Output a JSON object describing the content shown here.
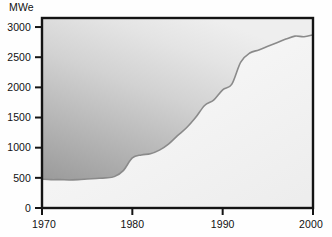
{
  "chart_data": {
    "type": "area",
    "title": "",
    "subtitle": "",
    "xlabel": "",
    "ylabel": "MWe",
    "ylabel_position": "top-left",
    "xlim": [
      1970,
      2000
    ],
    "ylim": [
      0,
      3150
    ],
    "grid": false,
    "legend": null,
    "annotations": [],
    "axis": {
      "y_ticks": [
        0,
        500,
        1000,
        1500,
        2000,
        2500,
        3000
      ],
      "y_tick_labels": [
        "0",
        "500",
        "1000",
        "1500",
        "2000",
        "2500",
        "3000"
      ],
      "x_ticks": [
        1970,
        1980,
        1990,
        2000
      ],
      "x_tick_labels": [
        "1970",
        "1980",
        "1990",
        "2000"
      ],
      "y_tick_side": "left",
      "x_tick_side": "bottom"
    },
    "series": [
      {
        "name": "Installed capacity",
        "unit": "MWe",
        "fill": "area-above-curve",
        "x": [
          1970,
          1971,
          1972,
          1973,
          1974,
          1975,
          1976,
          1977,
          1978,
          1979,
          1980,
          1981,
          1982,
          1983,
          1984,
          1985,
          1986,
          1987,
          1988,
          1989,
          1990,
          1991,
          1992,
          1993,
          1994,
          1995,
          1996,
          1997,
          1998,
          1999,
          2000
        ],
        "values": [
          480,
          470,
          470,
          465,
          470,
          480,
          490,
          500,
          520,
          620,
          830,
          880,
          900,
          960,
          1060,
          1200,
          1330,
          1500,
          1700,
          1790,
          1960,
          2050,
          2420,
          2570,
          2620,
          2680,
          2740,
          2800,
          2850,
          2840,
          2870
        ]
      }
    ]
  },
  "colors": {
    "frame": "#141414",
    "curve": "#8a8a8a",
    "fill_above_top": "#e9e9e9",
    "fill_above_bottom": "#9d9d9d",
    "fill_below": "#f4f4f4",
    "text": "#111111",
    "background": "#fefefe"
  }
}
